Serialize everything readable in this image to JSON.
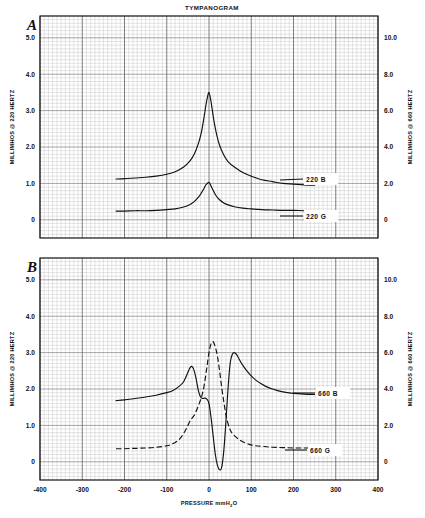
{
  "figure": {
    "title": "TYMPANOGRAM",
    "xlabel": "PRESSURE mmH2O",
    "xlabel_pre": "PRESSURE mmH",
    "xlabel_sub": "2",
    "xlabel_post": "O"
  },
  "panels": [
    {
      "letter": "A",
      "left_axis_label": "MILLIMHOS @ 220 HERTZ",
      "right_axis_label": "MILLIMHOS @ 660 HERTZ",
      "left_ticks": [
        "5.0",
        "4.0",
        "3.0",
        "2.0",
        "1.0",
        "0"
      ],
      "right_ticks": [
        "10.0",
        "8.0",
        "6.0",
        "4.0",
        "2.0",
        "0"
      ],
      "curve_labels": [
        "220 B",
        "220 G"
      ]
    },
    {
      "letter": "B",
      "left_axis_label": "MILLIMHOS @ 220 HERTZ",
      "right_axis_label": "MILLIMHOS @ 660 HERTZ",
      "left_ticks": [
        "5.0",
        "4.0",
        "3.0",
        "2.0",
        "1.0",
        "0"
      ],
      "right_ticks": [
        "10.0",
        "8.0",
        "6.0",
        "4.0",
        "2.0",
        "0"
      ],
      "curve_labels": [
        "660 B",
        "660 G"
      ]
    }
  ],
  "x_ticks": [
    "-400",
    "-300",
    "-200",
    "-100",
    "0",
    "100",
    "200",
    "300",
    "400"
  ],
  "chart_data": {
    "type": "line",
    "title": "TYMPANOGRAM",
    "xlabel": "PRESSURE mmH2O",
    "ylabel": "MILLIMHOS @ 220 HERTZ",
    "ylabel_right": "MILLIMHOS @ 660 HERTZ",
    "xlim": [
      -400,
      400
    ],
    "ylim": [
      -0.5,
      5.6
    ],
    "ylim_right": [
      -1.0,
      11.2
    ],
    "grid": true,
    "legend_position": "inline-right-of-curve",
    "panels": [
      {
        "panel": "A",
        "series": [
          {
            "name": "220 B",
            "style": "solid",
            "x": [
              -220,
              -200,
              -175,
              -150,
              -125,
              -100,
              -80,
              -60,
              -45,
              -35,
              -25,
              -18,
              -12,
              -8,
              -4,
              0,
              4,
              8,
              12,
              18,
              25,
              35,
              45,
              60,
              80,
              100,
              125,
              150,
              175,
              200,
              225,
              250
            ],
            "y": [
              1.12,
              1.13,
              1.15,
              1.17,
              1.2,
              1.25,
              1.32,
              1.45,
              1.62,
              1.8,
              2.1,
              2.4,
              2.8,
              3.1,
              3.35,
              3.5,
              3.3,
              3.0,
              2.7,
              2.35,
              2.05,
              1.78,
              1.6,
              1.45,
              1.3,
              1.2,
              1.1,
              1.05,
              1.0,
              0.98,
              0.96,
              0.95
            ]
          },
          {
            "name": "220 G",
            "style": "solid",
            "x": [
              -220,
              -200,
              -175,
              -150,
              -125,
              -100,
              -80,
              -60,
              -45,
              -35,
              -25,
              -18,
              -12,
              -8,
              -4,
              0,
              4,
              8,
              12,
              18,
              25,
              35,
              45,
              60,
              80,
              100,
              125,
              150,
              175,
              200,
              225,
              250
            ],
            "y": [
              0.24,
              0.24,
              0.25,
              0.25,
              0.26,
              0.28,
              0.3,
              0.35,
              0.42,
              0.5,
              0.62,
              0.74,
              0.86,
              0.95,
              1.0,
              1.03,
              0.95,
              0.85,
              0.76,
              0.64,
              0.55,
              0.46,
              0.41,
              0.36,
              0.32,
              0.3,
              0.28,
              0.27,
              0.26,
              0.26,
              0.25,
              0.25
            ]
          }
        ]
      },
      {
        "panel": "B",
        "series": [
          {
            "name": "660 B",
            "style": "solid",
            "x": [
              -220,
              -200,
              -175,
              -150,
              -125,
              -100,
              -85,
              -70,
              -60,
              -52,
              -45,
              -40,
              -35,
              -30,
              -25,
              -20,
              -15,
              -10,
              -5,
              0,
              5,
              10,
              15,
              20,
              25,
              30,
              35,
              40,
              45,
              50,
              55,
              60,
              65,
              70,
              80,
              95,
              110,
              130,
              150,
              175,
              200,
              225,
              250
            ],
            "y": [
              1.68,
              1.7,
              1.74,
              1.78,
              1.83,
              1.9,
              1.96,
              2.08,
              2.2,
              2.4,
              2.58,
              2.62,
              2.5,
              2.25,
              1.95,
              1.78,
              1.74,
              1.75,
              1.72,
              1.6,
              1.2,
              0.7,
              0.2,
              -0.1,
              -0.22,
              -0.15,
              0.3,
              1.1,
              2.0,
              2.7,
              2.95,
              3.0,
              2.95,
              2.85,
              2.65,
              2.42,
              2.25,
              2.1,
              2.0,
              1.92,
              1.88,
              1.86,
              1.85
            ]
          },
          {
            "name": "660 G",
            "style": "dashed",
            "x": [
              -220,
              -200,
              -175,
              -150,
              -125,
              -100,
              -85,
              -70,
              -60,
              -52,
              -45,
              -40,
              -35,
              -30,
              -25,
              -20,
              -15,
              -10,
              -5,
              0,
              5,
              10,
              15,
              20,
              25,
              30,
              35,
              40,
              45,
              50,
              55,
              60,
              70,
              80,
              95,
              110,
              130,
              150,
              175,
              200,
              225,
              250
            ],
            "y": [
              0.36,
              0.36,
              0.37,
              0.38,
              0.4,
              0.44,
              0.5,
              0.62,
              0.78,
              0.95,
              1.12,
              1.2,
              1.28,
              1.4,
              1.55,
              1.7,
              1.9,
              2.2,
              2.6,
              3.0,
              3.25,
              3.3,
              3.15,
              2.9,
              2.5,
              2.05,
              1.65,
              1.3,
              1.05,
              0.88,
              0.78,
              0.72,
              0.62,
              0.55,
              0.48,
              0.44,
              0.42,
              0.4,
              0.39,
              0.38,
              0.38,
              0.38
            ]
          }
        ]
      }
    ]
  }
}
